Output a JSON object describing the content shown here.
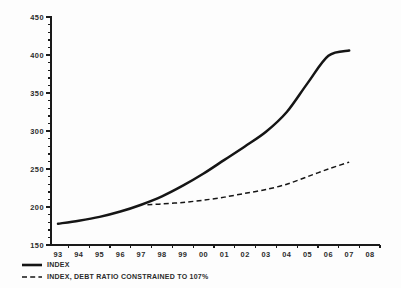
{
  "chart_data": {
    "type": "line",
    "title": "",
    "subtitle": "",
    "xlabel": "",
    "ylabel": "",
    "xlim": [
      93,
      108
    ],
    "ylim": [
      150,
      450
    ],
    "grid": false,
    "legend_position": "bottom-left",
    "x": [
      93,
      94,
      95,
      96,
      97,
      98,
      99,
      100,
      101,
      102,
      103,
      104,
      105,
      106,
      107
    ],
    "x_tick_labels": [
      "93",
      "94",
      "95",
      "96",
      "97",
      "98",
      "99",
      "00",
      "01",
      "02",
      "03",
      "04",
      "05",
      "06",
      "07",
      "08"
    ],
    "y_tick_labels": [
      "150",
      "200",
      "250",
      "300",
      "350",
      "400",
      "450"
    ],
    "y_ticks": [
      150,
      200,
      250,
      300,
      350,
      400,
      450
    ],
    "y_minor_step": 10,
    "series": [
      {
        "name": "INDEX",
        "style": "solid",
        "color": "#151515",
        "x": [
          93,
          94,
          95,
          96,
          97,
          98,
          99,
          100,
          101,
          102,
          103,
          104,
          105,
          106,
          107
        ],
        "values": [
          178,
          182,
          187,
          194,
          203,
          214,
          228,
          244,
          262,
          280,
          299,
          325,
          363,
          399,
          406
        ]
      },
      {
        "name": "INDEX, DEBT RATIO CONSTRAINED TO 107%",
        "style": "dashed",
        "color": "#151515",
        "x": [
          97.3,
          98,
          99,
          100,
          101,
          102,
          103,
          104,
          105,
          106,
          107
        ],
        "values": [
          203,
          204,
          206,
          209,
          213,
          218,
          223,
          230,
          240,
          250,
          259
        ]
      }
    ]
  },
  "legend": {
    "items": [
      {
        "label": "INDEX",
        "style": "solid"
      },
      {
        "label": "INDEX, DEBT RATIO CONSTRAINED TO 107%",
        "style": "dashed"
      }
    ]
  },
  "colors": {
    "background": "#fdfdfd",
    "ink": "#151515",
    "text": "#2b2b2b"
  }
}
